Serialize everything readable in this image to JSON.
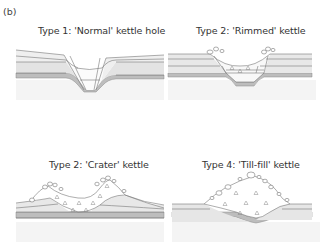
{
  "figure": {
    "panel_tag": "(b)",
    "colors": {
      "line": "#777777",
      "layer_light": "#ececec",
      "layer_mid": "#dcdcdc",
      "layer_dark": "#b8b8b8",
      "base": "#f3f3f3",
      "till_fill": "#ffffff"
    },
    "panels": [
      {
        "id": "type1",
        "title": "Type 1: 'Normal' kettle hole"
      },
      {
        "id": "type2-rimmed",
        "title": "Type 2: 'Rimmed' kettle"
      },
      {
        "id": "type2-crater",
        "title": "Type 2: 'Crater' kettle"
      },
      {
        "id": "type4",
        "title": "Type 4: 'Till-fill' kettle"
      }
    ]
  }
}
